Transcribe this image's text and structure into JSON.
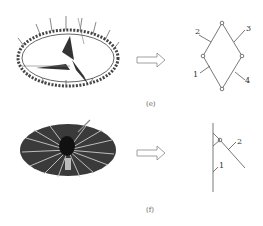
{
  "figure": {
    "panels": [
      {
        "id": "e",
        "caption": "(e)",
        "left_image": "scissor-ring-deployable-structure",
        "arrow": "right-arrow",
        "schematic": "rhombus-linkage",
        "member_labels": [
          "1",
          "2",
          "3",
          "4"
        ]
      },
      {
        "id": "f",
        "caption": "(f)",
        "left_image": "umbrella-deployable-structure",
        "arrow": "right-arrow",
        "schematic": "umbrella-rib-linkage",
        "member_labels": [
          "1",
          "2"
        ]
      }
    ]
  },
  "colors": {
    "line": "#555555",
    "arrow": "#888888",
    "text": "#333333"
  }
}
